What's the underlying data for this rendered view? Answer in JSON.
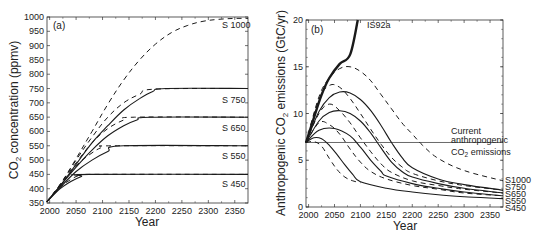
{
  "chart_data": [
    {
      "type": "line",
      "panel": "(a)",
      "title": "",
      "xlabel": "Year",
      "ylabel": "CO2 concentration (ppmv)",
      "ylabel_main": "CO",
      "ylabel_sub": "2",
      "ylabel_rest": " concentration (ppmv)",
      "xlim": [
        1995,
        2375
      ],
      "ylim": [
        350,
        1000
      ],
      "xticks": [
        2000,
        2050,
        2100,
        2150,
        2200,
        2250,
        2300,
        2350
      ],
      "yticks": [
        350,
        400,
        450,
        500,
        550,
        600,
        650,
        700,
        750,
        800,
        850,
        900,
        950,
        1000
      ],
      "grid": false,
      "series": [
        {
          "name": "S 450",
          "style": "solid",
          "x": [
            1995,
            2020,
            2040,
            2060,
            2075,
            2375
          ],
          "y": [
            355,
            400,
            425,
            443,
            450,
            450
          ]
        },
        {
          "name": "S 450 (dashed)",
          "style": "dashed",
          "x": [
            1995,
            2020,
            2040,
            2055,
            2070,
            2375
          ],
          "y": [
            355,
            405,
            432,
            446,
            450,
            450
          ]
        },
        {
          "name": "S 550",
          "style": "solid",
          "x": [
            1995,
            2020,
            2050,
            2080,
            2110,
            2140,
            2375
          ],
          "y": [
            355,
            405,
            460,
            500,
            530,
            550,
            550
          ]
        },
        {
          "name": "S 550 (dashed)",
          "style": "dashed",
          "x": [
            1995,
            2020,
            2050,
            2080,
            2100,
            2120,
            2375
          ],
          "y": [
            355,
            410,
            480,
            525,
            545,
            550,
            550
          ]
        },
        {
          "name": "S 650",
          "style": "solid",
          "x": [
            1995,
            2020,
            2050,
            2080,
            2110,
            2140,
            2165,
            2190,
            2375
          ],
          "y": [
            355,
            410,
            475,
            535,
            585,
            620,
            640,
            650,
            650
          ]
        },
        {
          "name": "S 650 (dashed)",
          "style": "dashed",
          "x": [
            1995,
            2020,
            2050,
            2080,
            2110,
            2140,
            2160,
            2375
          ],
          "y": [
            355,
            415,
            490,
            560,
            610,
            640,
            650,
            650
          ]
        },
        {
          "name": "S 750",
          "style": "solid",
          "x": [
            1995,
            2020,
            2050,
            2080,
            2110,
            2140,
            2170,
            2195,
            2220,
            2375
          ],
          "y": [
            355,
            410,
            485,
            560,
            620,
            675,
            715,
            740,
            750,
            750
          ]
        },
        {
          "name": "S 750 (dashed)",
          "style": "dashed",
          "x": [
            1995,
            2020,
            2050,
            2080,
            2110,
            2140,
            2170,
            2200,
            2375
          ],
          "y": [
            355,
            415,
            500,
            580,
            650,
            700,
            730,
            748,
            750
          ]
        },
        {
          "name": "S 1000",
          "style": "dashed",
          "x": [
            1995,
            2020,
            2050,
            2080,
            2110,
            2140,
            2170,
            2200,
            2230,
            2260,
            2290,
            2320,
            2350,
            2375
          ],
          "y": [
            355,
            415,
            505,
            600,
            695,
            780,
            850,
            905,
            945,
            970,
            985,
            992,
            995,
            995
          ]
        }
      ],
      "annotations": [
        "S 1000",
        "S 750",
        "S 650",
        "S 550",
        "S 450"
      ]
    },
    {
      "type": "line",
      "panel": "(b)",
      "title": "",
      "xlabel": "Year",
      "ylabel": "Anthropogenic CO2 emissions (GtC/yr)",
      "ylabel_main": "Anthropogenic CO",
      "ylabel_sub": "2",
      "ylabel_rest": " emissions (GtC/yr)",
      "xlim": [
        1995,
        2375
      ],
      "ylim": [
        0,
        20
      ],
      "xticks": [
        2000,
        2050,
        2100,
        2150,
        2200,
        2250,
        2300,
        2350
      ],
      "yticks": [
        0,
        5,
        10,
        15,
        20
      ],
      "grid": false,
      "reference_line": {
        "y": 6.9,
        "label_line1": "Current",
        "label_line2": "anthropogenic",
        "label_line3_main": "CO",
        "label_line3_sub": "2",
        "label_line3_rest": " emissions"
      },
      "series": [
        {
          "name": "IS92a",
          "style": "solid-bold",
          "x": [
            1995,
            2010,
            2025,
            2040,
            2060,
            2080,
            2095
          ],
          "y": [
            6.9,
            9.5,
            12.0,
            13.8,
            15.3,
            16.3,
            20.0
          ]
        },
        {
          "name": "S450",
          "style": "solid",
          "x": [
            1995,
            2010,
            2025,
            2040,
            2055,
            2070,
            2085,
            2100,
            2150,
            2200,
            2250,
            2300,
            2375
          ],
          "y": [
            6.9,
            7.4,
            7.3,
            6.6,
            5.6,
            4.5,
            3.5,
            2.7,
            2.0,
            1.6,
            1.3,
            1.1,
            0.9
          ]
        },
        {
          "name": "S450 (dashed)",
          "style": "dashed",
          "x": [
            1995,
            2010,
            2025,
            2040,
            2055,
            2070,
            2085,
            2100
          ],
          "y": [
            6.9,
            7.0,
            6.5,
            5.2,
            4.0,
            3.2,
            2.8,
            2.6
          ]
        },
        {
          "name": "S550",
          "style": "solid",
          "x": [
            1995,
            2020,
            2050,
            2080,
            2100,
            2120,
            2140,
            2150,
            2200,
            2250,
            2300,
            2375
          ],
          "y": [
            6.9,
            8.2,
            8.4,
            7.6,
            6.4,
            5.0,
            3.8,
            3.3,
            2.5,
            2.0,
            1.6,
            1.2
          ]
        },
        {
          "name": "S550 (dashed)",
          "style": "dashed",
          "x": [
            1995,
            2020,
            2040,
            2060,
            2080,
            2100,
            2120,
            2150,
            2200,
            2250,
            2300,
            2375
          ],
          "y": [
            6.9,
            9.0,
            8.8,
            7.8,
            6.2,
            4.8,
            3.8,
            3.0,
            2.3,
            1.9,
            1.5,
            1.2
          ]
        },
        {
          "name": "S650",
          "style": "solid",
          "x": [
            1995,
            2020,
            2040,
            2060,
            2080,
            2100,
            2120,
            2140,
            2160,
            2180,
            2200,
            2250,
            2300,
            2375
          ],
          "y": [
            6.9,
            9.2,
            10.1,
            10.3,
            10.0,
            9.2,
            7.9,
            6.3,
            4.8,
            3.8,
            3.2,
            2.5,
            2.0,
            1.5
          ]
        },
        {
          "name": "S650 (dashed)",
          "style": "dashed",
          "x": [
            1995,
            2020,
            2040,
            2060,
            2080,
            2100,
            2120,
            2140,
            2160,
            2200,
            2250,
            2300,
            2375
          ],
          "y": [
            6.9,
            10.0,
            11.0,
            10.3,
            9.0,
            7.4,
            5.9,
            4.6,
            3.7,
            2.8,
            2.3,
            1.9,
            1.5
          ]
        },
        {
          "name": "S750",
          "style": "solid",
          "x": [
            1995,
            2020,
            2040,
            2060,
            2080,
            2100,
            2120,
            2140,
            2160,
            2180,
            2200,
            2250,
            2300,
            2375
          ],
          "y": [
            6.9,
            10.2,
            11.7,
            12.3,
            12.2,
            11.5,
            10.3,
            8.7,
            6.9,
            5.3,
            4.2,
            3.0,
            2.4,
            1.8
          ]
        },
        {
          "name": "S750 (dashed)",
          "style": "dashed",
          "x": [
            1995,
            2020,
            2040,
            2060,
            2080,
            2100,
            2120,
            2140,
            2160,
            2180,
            2200,
            2250,
            2300,
            2375
          ],
          "y": [
            6.9,
            11.5,
            13.0,
            12.8,
            11.6,
            10.0,
            8.3,
            6.7,
            5.3,
            4.3,
            3.6,
            2.8,
            2.3,
            1.8
          ]
        },
        {
          "name": "S1000",
          "style": "dashed",
          "x": [
            1995,
            2020,
            2040,
            2060,
            2080,
            2100,
            2120,
            2140,
            2160,
            2180,
            2200,
            2220,
            2250,
            2300,
            2375
          ],
          "y": [
            6.9,
            11.8,
            13.8,
            14.8,
            15.0,
            14.5,
            13.5,
            12.0,
            10.5,
            9.0,
            7.8,
            6.6,
            5.2,
            3.9,
            2.8
          ]
        }
      ],
      "annotations": [
        "IS92a",
        "S1000",
        "S750",
        "S650",
        "S550",
        "S450"
      ]
    }
  ],
  "panels": {
    "a": {
      "label": "(a)",
      "xlabel": "Year",
      "ylabel_main": "CO",
      "ylabel_sub": "2",
      "ylabel_rest": " concentration (ppmv)",
      "xtick_labels": [
        "2000",
        "2050",
        "2100",
        "2150",
        "2200",
        "2250",
        "2300",
        "2350"
      ],
      "ytick_labels": [
        "350",
        "400",
        "450",
        "500",
        "550",
        "600",
        "650",
        "700",
        "750",
        "800",
        "850",
        "900",
        "950",
        "1000"
      ],
      "series_labels": [
        "S 1000",
        "S 750",
        "S 650",
        "S 550",
        "S 450"
      ]
    },
    "b": {
      "label": "(b)",
      "xlabel": "Year",
      "ylabel_main": "Anthropogenic CO",
      "ylabel_sub": "2",
      "ylabel_rest": " emissions (GtC/yr)",
      "xtick_labels": [
        "2000",
        "2050",
        "2100",
        "2150",
        "2200",
        "2250",
        "2300",
        "2350"
      ],
      "ytick_labels": [
        "0",
        "5",
        "10",
        "15",
        "20"
      ],
      "is92a_label": "IS92a",
      "series_labels": [
        "S1000",
        "S750",
        "S650",
        "S550",
        "S450"
      ],
      "ref_line1": "Current",
      "ref_line2": "anthropogenic",
      "ref_line3_main": "CO",
      "ref_line3_sub": "2",
      "ref_line3_rest": " emissions"
    }
  },
  "colors": {
    "line": "#1a1a1a",
    "axis": "#333333",
    "text": "#222222",
    "background": "#ffffff"
  }
}
